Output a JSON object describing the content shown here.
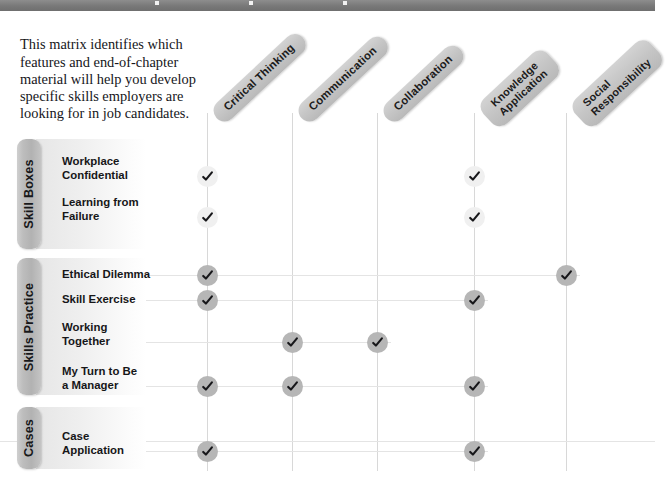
{
  "top_band": {
    "dots": 3
  },
  "intro": {
    "text": "This matrix identifies which features and end-of-chapter material will help you develop specific skills employers are looking for in job candidates."
  },
  "columns": [
    {
      "id": "critical-thinking",
      "label": "Critical Thinking",
      "lines": [
        "Critical Thinking"
      ],
      "x": 207
    },
    {
      "id": "communication",
      "label": "Communication",
      "lines": [
        "Communication"
      ],
      "x": 292
    },
    {
      "id": "collaboration",
      "label": "Collaboration",
      "lines": [
        "Collaboration"
      ],
      "x": 377
    },
    {
      "id": "knowledge-application",
      "label": "Knowledge Application",
      "lines": [
        "Knowledge",
        "Application"
      ],
      "x": 474
    },
    {
      "id": "social-responsibility",
      "label": "Social Responsibility",
      "lines": [
        "Social",
        "Responsibility"
      ],
      "x": 566
    }
  ],
  "groups": [
    {
      "id": "skill-boxes",
      "label": "Skill Boxes",
      "mark_style": "light",
      "tab": {
        "top": 139,
        "height": 110
      },
      "rows": [
        {
          "id": "workplace-confidential",
          "label": "Workplace\nConfidential",
          "y": 155,
          "marks": [
            "critical-thinking",
            "knowledge-application"
          ]
        },
        {
          "id": "learning-from-failure",
          "label": "Learning from\nFailure",
          "y": 196,
          "marks": [
            "critical-thinking",
            "knowledge-application"
          ]
        }
      ]
    },
    {
      "id": "skills-practice",
      "label": "Skills Practice",
      "mark_style": "dark",
      "tab": {
        "top": 258,
        "height": 137
      },
      "rows": [
        {
          "id": "ethical-dilemma",
          "label": "Ethical Dilemma",
          "y": 268,
          "marks": [
            "critical-thinking",
            "social-responsibility"
          ]
        },
        {
          "id": "skill-exercise",
          "label": "Skill Exercise",
          "y": 293,
          "marks": [
            "critical-thinking",
            "knowledge-application"
          ]
        },
        {
          "id": "working-together",
          "label": "Working\nTogether",
          "y": 321,
          "marks": [
            "communication",
            "collaboration"
          ]
        },
        {
          "id": "my-turn-to-be-a-manager",
          "label": "My Turn to Be\na Manager",
          "y": 365,
          "marks": [
            "critical-thinking",
            "communication",
            "knowledge-application"
          ]
        }
      ]
    },
    {
      "id": "cases",
      "label": "Cases",
      "mark_style": "dark",
      "tab": {
        "top": 407,
        "height": 62
      },
      "rows": [
        {
          "id": "case-application",
          "label": "Case\nApplication",
          "y": 430,
          "marks": [
            "critical-thinking",
            "knowledge-application"
          ]
        }
      ]
    }
  ],
  "icons": {
    "check": "check-icon"
  },
  "colors": {
    "band": "#7a7a7a",
    "chip": "#c6c6c6",
    "tab": "#b9b9b9",
    "mark_light": "#f0f0f0",
    "mark_dark": "#b6b6b6",
    "rail_v": "#d8d8d8",
    "rail_h": "#e4e4e4",
    "text": "#16161a"
  }
}
